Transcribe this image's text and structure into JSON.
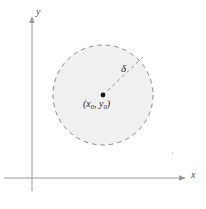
{
  "figure": {
    "kind": "math-diagram",
    "background_color": "#ffffff"
  },
  "axes": {
    "x_label": "x",
    "y_label": "y",
    "color": "#9a9a9a",
    "origin": {
      "x": 32,
      "y": 178
    },
    "x_axis": {
      "start_x": 4,
      "end_x": 186,
      "y": 178,
      "arrow": "right"
    },
    "y_axis": {
      "x": 32,
      "start_y": 190,
      "end_y": 16,
      "arrow": "up"
    }
  },
  "disk": {
    "center_label": "(x",
    "center_label_sub1": "0",
    "center_label_mid": ", y",
    "center_label_sub2": "0",
    "center_label_end": ")",
    "center_point": {
      "x": 103,
      "y": 95
    },
    "radius": 50,
    "fill_color": "#f0f0f0",
    "stroke_color": "#8a8a8a",
    "stroke_style": "dashed",
    "center_dot_color": "#1a1a1a"
  },
  "radius_annotation": {
    "label": "δ",
    "line_style": "dashed",
    "line_color": "#8a8a8a",
    "from": {
      "x": 103,
      "y": 95
    },
    "to": {
      "x": 143,
      "y": 57
    }
  },
  "artifact": {
    "color": "#c9c9c9"
  }
}
